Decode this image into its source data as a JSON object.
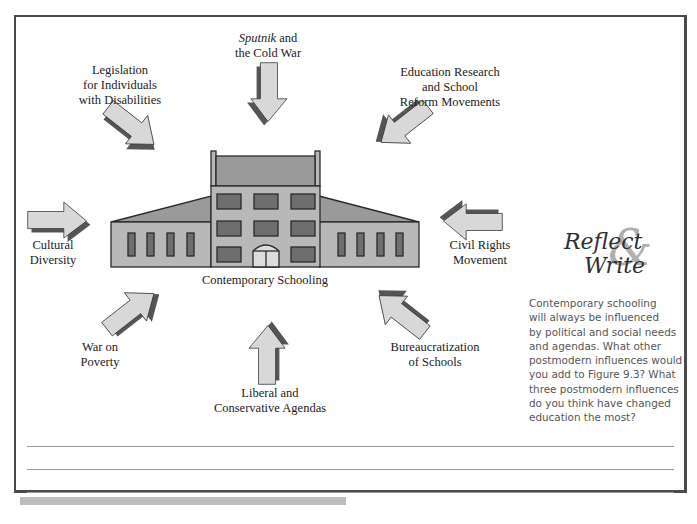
{
  "figure": {
    "center_label": "Contemporary Schooling",
    "influences": [
      {
        "id": "sputnik",
        "italic_part": "Sputnik",
        "line1_rest": " and",
        "line2": "the Cold War",
        "direction": "down"
      },
      {
        "id": "legislation",
        "lines": [
          "Legislation",
          "for Individuals",
          "with Disabilities"
        ],
        "direction": "down-right"
      },
      {
        "id": "education-research",
        "lines": [
          "Education Research",
          "and School",
          "Reform Movements"
        ],
        "direction": "down-left"
      },
      {
        "id": "cultural-diversity",
        "lines": [
          "Cultural",
          "Diversity"
        ],
        "direction": "right"
      },
      {
        "id": "civil-rights",
        "lines": [
          "Civil Rights",
          "Movement"
        ],
        "direction": "left"
      },
      {
        "id": "war-on-poverty",
        "lines": [
          "War on",
          "Poverty"
        ],
        "direction": "up-right"
      },
      {
        "id": "bureaucratization",
        "lines": [
          "Bureaucratization",
          "of Schools"
        ],
        "direction": "up-left"
      },
      {
        "id": "liberal-conservative",
        "lines": [
          "Liberal and",
          "Conservative Agendas"
        ],
        "direction": "up"
      }
    ],
    "colors": {
      "arrow_fill": "#d8d8d8",
      "arrow_shadow": "#555555",
      "building_wall": "#b8b8b8",
      "building_window": "#6e6e6e",
      "roof": "#9a9a9a",
      "outline": "#2a2a2a"
    }
  },
  "reflect_write": {
    "title_word1": "Reflect",
    "ampersand": "&",
    "title_word2": "Write",
    "prompt": "Contemporary schooling will always be influenced by political and social needs and agendas. What other postmodern influences would you add to Figure 9.3? What three postmodern influences do you think have changed education the most?",
    "prompt_lines": [
      "Contemporary schooling",
      "will always be influenced",
      "by political and social needs",
      "and agendas. What other",
      "postmodern influences would",
      "you add to Figure 9.3? What",
      "three postmodern influences",
      "do you think have changed",
      "education the most?"
    ]
  },
  "answer_lines_count": 3
}
